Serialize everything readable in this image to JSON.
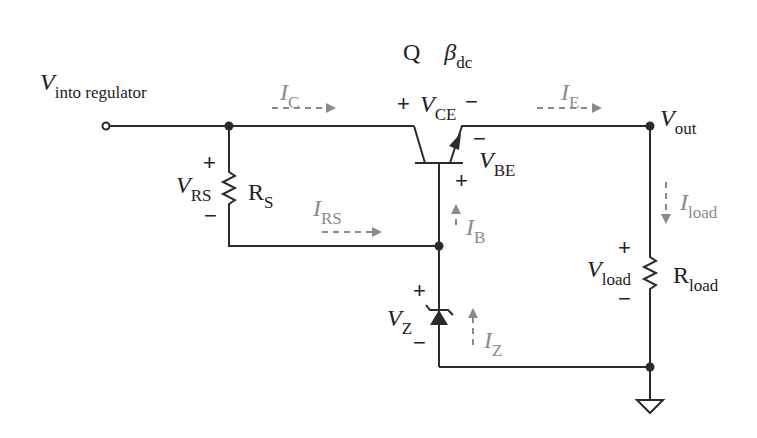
{
  "transistor": {
    "name": "Q",
    "beta_symbol": "β",
    "beta_sub": "dc"
  },
  "labels": {
    "vin": {
      "main": "V",
      "sub": "into regulator"
    },
    "vout": {
      "main": "V",
      "sub": "out"
    },
    "vce": {
      "main": "V",
      "sub": "CE",
      "plus": "+",
      "minus": "−"
    },
    "vbe": {
      "main": "V",
      "sub": "BE",
      "plus": "+",
      "minus": "−"
    },
    "vrs": {
      "main": "V",
      "sub": "RS",
      "plus": "+",
      "minus": "−"
    },
    "rs": {
      "main": "R",
      "sub": "S"
    },
    "vz": {
      "main": "V",
      "sub": "Z",
      "plus": "+",
      "minus": "−"
    },
    "vload": {
      "main": "V",
      "sub": "load",
      "plus": "+",
      "minus": "−"
    },
    "rload": {
      "main": "R",
      "sub": "load"
    }
  },
  "currents": {
    "ic": {
      "main": "I",
      "sub": "C"
    },
    "ie": {
      "main": "I",
      "sub": "E"
    },
    "irs": {
      "main": "I",
      "sub": "RS"
    },
    "ib": {
      "main": "I",
      "sub": "B"
    },
    "iz": {
      "main": "I",
      "sub": "Z"
    },
    "iload": {
      "main": "I",
      "sub": "load"
    }
  },
  "colors": {
    "wire": "#2b2b2b",
    "current_arrow": "#8a8a8a"
  }
}
